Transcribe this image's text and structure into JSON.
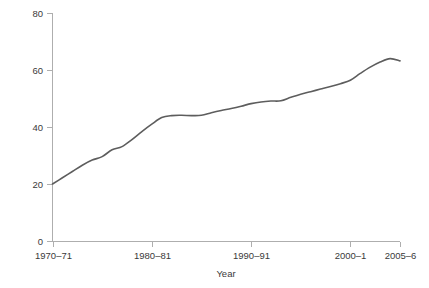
{
  "chart_data": {
    "type": "line",
    "title": "",
    "xlabel": "Year",
    "ylabel": "Percentages",
    "xlim": [
      1970,
      2005
    ],
    "ylim": [
      0,
      80
    ],
    "grid": false,
    "legend": "none",
    "y_ticks": [
      0,
      20,
      40,
      60,
      80
    ],
    "y_tick_labels": [
      "0",
      "20",
      "40",
      "60",
      "80"
    ],
    "x_ticks": [
      1970,
      1980,
      1990,
      2000,
      2005
    ],
    "x_tick_labels": [
      "1970–71",
      "1980–81",
      "1990–91",
      "2000–1",
      "2005–6"
    ],
    "series": [
      {
        "name": "Percentages",
        "color": "#5d5d5d",
        "x": [
          1970,
          1971,
          1972,
          1973,
          1974,
          1975,
          1976,
          1977,
          1978,
          1979,
          1980,
          1981,
          1982,
          1983,
          1984,
          1985,
          1986,
          1987,
          1988,
          1989,
          1990,
          1991,
          1992,
          1993,
          1994,
          1995,
          1996,
          1997,
          1998,
          1999,
          2000,
          2001,
          2002,
          2003,
          2004,
          2005
        ],
        "values": [
          20.0,
          22.2,
          24.4,
          26.6,
          28.4,
          29.6,
          32.0,
          33.1,
          35.6,
          38.4,
          41.0,
          43.3,
          44.0,
          44.1,
          44.0,
          44.1,
          45.0,
          45.8,
          46.5,
          47.3,
          48.2,
          48.8,
          49.1,
          49.2,
          50.4,
          51.5,
          52.4,
          53.3,
          54.2,
          55.2,
          56.4,
          58.8,
          61.0,
          62.8,
          64.0,
          63.2
        ]
      }
    ]
  },
  "axes": {
    "y_label": "Percentages",
    "x_label": "Year"
  }
}
